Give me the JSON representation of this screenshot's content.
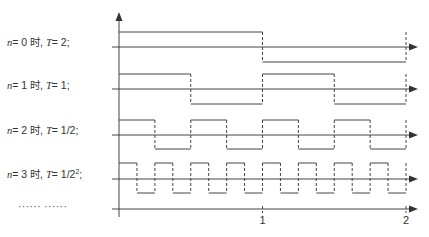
{
  "diagram": {
    "rows": [
      {
        "n": "0",
        "sep": "时,",
        "T": "2",
        "T_sup": "",
        "label_top": 36,
        "baseline_y": 47,
        "high_y": 32,
        "low_y": 62,
        "period": 2
      },
      {
        "n": "1",
        "sep": "时,",
        "T": "1",
        "T_sup": "",
        "label_top": 79,
        "baseline_y": 89,
        "high_y": 74,
        "low_y": 104,
        "period": 1
      },
      {
        "n": "2",
        "sep": "时,",
        "T": "1/2",
        "T_sup": "",
        "label_top": 124,
        "baseline_y": 135,
        "high_y": 120,
        "low_y": 149,
        "period": 0.5
      },
      {
        "n": "3",
        "sep": "时,",
        "T": "1/2",
        "T_sup": "2",
        "label_top": 168,
        "baseline_y": 179,
        "high_y": 163,
        "low_y": 193,
        "period": 0.25
      }
    ],
    "ellipsis": "······ ······",
    "axis": {
      "origin_x": 119,
      "unit_px": 143.5,
      "x_axis_y": 209,
      "y_axis_top": 12,
      "y_axis_bottom": 217,
      "arrow_x": 418,
      "ticks": [
        {
          "value": 1,
          "label": "1"
        },
        {
          "value": 2,
          "label": "2"
        }
      ]
    },
    "colors": {
      "line": "#444444",
      "axis": "#333333"
    }
  }
}
